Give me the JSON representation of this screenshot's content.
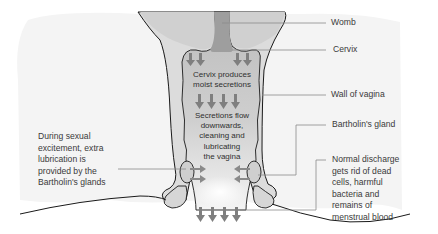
{
  "diagram": {
    "colors": {
      "background": "#ffffff",
      "tissue": "#f3f3f3",
      "wall": "#d9d9d9",
      "cavity": "#c4c4c4",
      "womb_fill": "#b0b0b0",
      "outline": "#1a1a1a",
      "arrow": "#808080",
      "leader_line": "#8c8c8c",
      "text": "#3a3a3a"
    },
    "labels": {
      "womb": "Womb",
      "cervix": "Cervix",
      "wall_of_vagina": "Wall of vagina",
      "bartholins_gland": "Bartholin's gland",
      "normal_discharge": [
        "Normal discharge",
        "gets rid of dead",
        "cells, harmful",
        "bacteria and",
        "remains of",
        "menstrual blood"
      ],
      "sexual_excitement": [
        "During sexual",
        "excitement, extra",
        "lubrication is",
        "provided by the",
        "Bartholin's glands"
      ]
    },
    "inner_text": {
      "cervix_produces": [
        "Cervix produces",
        "moist secretions"
      ],
      "secretions_flow": [
        "Secretions flow",
        "downwards,",
        "cleaning and",
        "lubricating",
        "the vagina"
      ]
    },
    "icons": {
      "down_arrow": "down-arrow-icon",
      "side_arrow": "side-arrow-icon"
    }
  }
}
